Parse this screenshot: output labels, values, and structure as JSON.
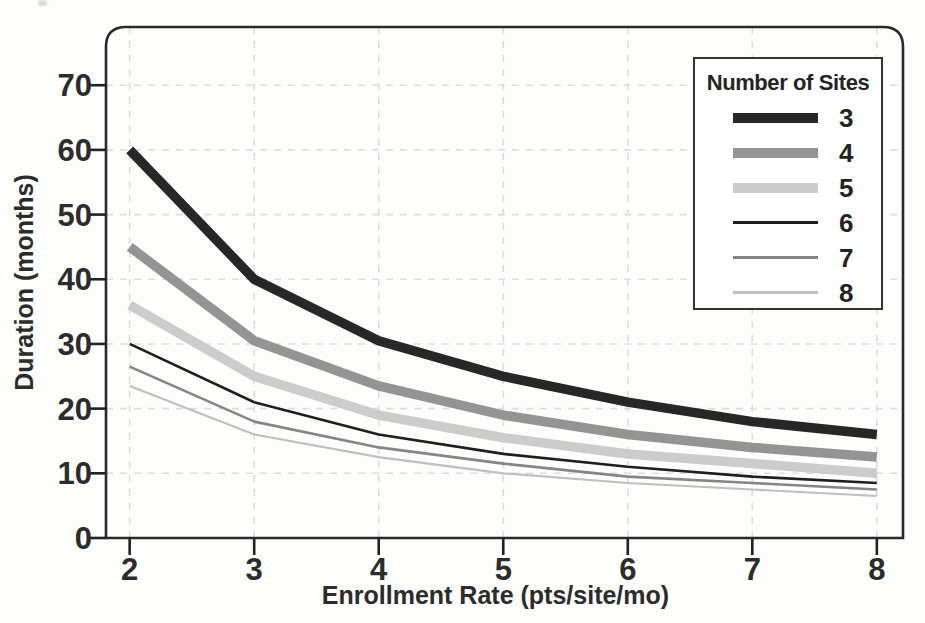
{
  "chart_data": {
    "type": "line",
    "title": "",
    "xlabel": "Enrollment Rate (pts/site/mo)",
    "ylabel": "Duration (months)",
    "x": [
      2,
      3,
      4,
      5,
      6,
      7,
      8
    ],
    "x_ticks": [
      "2",
      "3",
      "4",
      "5",
      "6",
      "7",
      "8"
    ],
    "y_ticks": [
      0,
      10,
      20,
      30,
      40,
      50,
      60,
      70
    ],
    "xlim": [
      1.81,
      8.21
    ],
    "ylim": [
      0,
      79
    ],
    "grid": "dashed light-gray, vertical at each x tick and horizontal at each y tick",
    "legend_position": "top-right",
    "series": [
      {
        "name": "3",
        "values": [
          60,
          40,
          30.5,
          25,
          21,
          18,
          16
        ],
        "color": "#272727",
        "width": 9.5
      },
      {
        "name": "4",
        "values": [
          45,
          30.5,
          23.5,
          19,
          16,
          14,
          12.5
        ],
        "color": "#949494",
        "width": 9.5
      },
      {
        "name": "5",
        "values": [
          36,
          25,
          19,
          15.5,
          13,
          11.5,
          10
        ],
        "color": "#cccccc",
        "width": 9.5
      },
      {
        "name": "6",
        "values": [
          30,
          21,
          16,
          13,
          11,
          9.5,
          8.5
        ],
        "color": "#1e1e1e",
        "width": 2.6
      },
      {
        "name": "7",
        "values": [
          26.5,
          18,
          14,
          11.5,
          9.5,
          8.5,
          7.5
        ],
        "color": "#858585",
        "width": 2.6
      },
      {
        "name": "8",
        "values": [
          23.5,
          16,
          12.5,
          10,
          8.5,
          7.5,
          6.5
        ],
        "color": "#bfbfbf",
        "width": 2.2
      }
    ]
  },
  "legend": {
    "title": "Number of Sites",
    "entries": [
      {
        "label": "3"
      },
      {
        "label": "4"
      },
      {
        "label": "5"
      },
      {
        "label": "6"
      },
      {
        "label": "7"
      },
      {
        "label": "8"
      }
    ]
  },
  "style": {
    "frame_color": "#2a2a2a",
    "tick_color": "#222222",
    "grid_color": "#dddddd",
    "label_color": "#2c2c2c"
  }
}
